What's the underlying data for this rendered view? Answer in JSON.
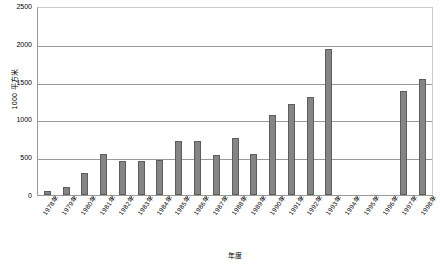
{
  "chart_data": {
    "type": "bar",
    "title": "",
    "xlabel": "年度",
    "ylabel": "1000 平方米",
    "ylim": [
      0,
      2500
    ],
    "ytick_labels": [
      "2500",
      "2000",
      "1500",
      "1000",
      "500",
      "0"
    ],
    "ytick_values": [
      2500,
      2000,
      1500,
      1000,
      500,
      0
    ],
    "grid": "horizontal",
    "legend": "none",
    "bar_color": "#858585",
    "bar_border_color": "#5d5d5d",
    "categories": [
      "1978年",
      "1979年",
      "1980年",
      "1981年",
      "1982年",
      "1983年",
      "1984年",
      "1985年",
      "1986年",
      "1987年",
      "1988年",
      "1989年",
      "1990年",
      "1991年",
      "1992年",
      "1993年",
      "1994年",
      "1995年",
      "1996年",
      "1997年",
      "1998年"
    ],
    "values": [
      50,
      100,
      290,
      540,
      450,
      450,
      460,
      710,
      710,
      530,
      760,
      540,
      1060,
      1200,
      1290,
      1930,
      0,
      0,
      0,
      1370,
      1540
    ]
  }
}
